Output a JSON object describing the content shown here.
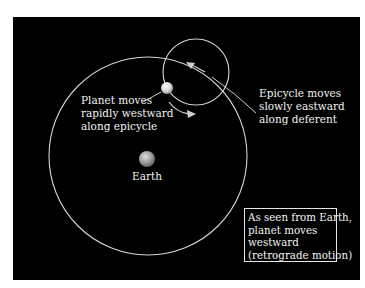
{
  "diagram": {
    "labels": {
      "planet": [
        "Planet moves",
        "rapidly westward",
        "along epicycle"
      ],
      "epicycle": [
        "Epicycle moves",
        "slowly eastward",
        "along deferent"
      ],
      "earth": "Earth",
      "note": [
        "As seen from Earth,",
        "planet moves",
        "westward",
        "(retrograde motion)"
      ]
    },
    "elements": {
      "deferent": {
        "cx": 148,
        "cy": 156,
        "r": 99
      },
      "epicycle": {
        "cx": 196,
        "cy": 72,
        "r": 33
      },
      "planet": {
        "cx": 167,
        "cy": 88,
        "r": 6
      },
      "earth": {
        "cx": 147,
        "cy": 159,
        "r": 8
      }
    },
    "colors": {
      "background": "#000000",
      "lines": "#d9d9d9",
      "text": "#f2f2f2",
      "page": "#ffffff"
    }
  }
}
